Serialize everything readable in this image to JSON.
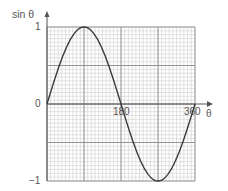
{
  "chart_data": {
    "type": "line",
    "title": "",
    "xlabel": "θ",
    "ylabel": "sin θ",
    "xlim": [
      0,
      360
    ],
    "ylim": [
      -1,
      1
    ],
    "x_ticks": [
      {
        "value": 180,
        "label": "180"
      },
      {
        "value": 360,
        "label": "360"
      }
    ],
    "y_ticks": [
      {
        "value": 1,
        "label": "1"
      },
      {
        "value": 0,
        "label": "0"
      },
      {
        "value": -1,
        "label": "−1"
      }
    ],
    "grid": {
      "on": true,
      "major_x_step": 90,
      "major_y_step": 0.5,
      "minor_divisions": 10
    },
    "legend": null,
    "series": [
      {
        "name": "sin θ",
        "x": [
          0,
          30,
          60,
          90,
          120,
          150,
          180,
          210,
          240,
          270,
          300,
          330,
          360
        ],
        "values": [
          0,
          0.5,
          0.866,
          1,
          0.866,
          0.5,
          0,
          -0.5,
          -0.866,
          -1,
          -0.866,
          -0.5,
          0
        ]
      }
    ]
  },
  "labels": {
    "y_axis": "sin θ",
    "x_axis": "θ",
    "y_top": "1",
    "y_zero": "0",
    "y_bottom": "−1",
    "x_180": "180",
    "x_360": "360"
  },
  "colors": {
    "curve": "#3a3a3a",
    "major_grid": "#8c8c8c",
    "minor_grid": "#cfcfcf",
    "axis": "#555555",
    "text": "#555555"
  }
}
